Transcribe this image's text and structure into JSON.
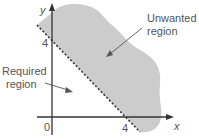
{
  "diagram": {
    "type": "linear-inequality-region",
    "axes": {
      "x_label": "x",
      "y_label": "y",
      "origin_label": "0",
      "x_tick_label": "4",
      "y_tick_label": "4"
    },
    "boundary": {
      "equation_hint": "x + y = 4",
      "style": "dashed"
    },
    "regions": {
      "unwanted": {
        "line1": "Unwanted",
        "line2": "region",
        "fill": "#cccccc"
      },
      "required": {
        "line1": "Required",
        "line2": "region"
      }
    },
    "colors": {
      "axis": "#333333",
      "shade": "#cccccc",
      "text": "#555555",
      "dash": "#333333"
    }
  }
}
